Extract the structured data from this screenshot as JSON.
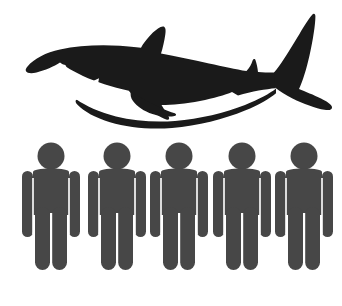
{
  "scene": {
    "title": "Shark and five people silhouette infographic",
    "background_color": "#ffffff",
    "width": 342,
    "height": 306
  },
  "shark": {
    "label": "Shark silhouette",
    "icon_name": "shark-icon",
    "color": "#1a1a1a",
    "facing": "left",
    "count": 1,
    "eye": {
      "label": "Shark eye",
      "color": "#ffffff",
      "cx": 63,
      "cy": 68,
      "r": 3.4
    },
    "mouth": {
      "label": "Shark mouth with teeth",
      "color": "#ffffff",
      "teeth_count": 4
    },
    "parts": [
      {
        "name": "snout",
        "label": "Snout"
      },
      {
        "name": "dorsal-fin",
        "label": "Dorsal fin"
      },
      {
        "name": "pectoral-fin",
        "label": "Pectoral fin"
      },
      {
        "name": "caudal-fin",
        "label": "Tail fin"
      },
      {
        "name": "belly",
        "label": "Belly"
      }
    ]
  },
  "people": {
    "label": "People silhouettes",
    "icon_name": "person-icon",
    "color": "#474747",
    "count": 5,
    "figures": [
      {
        "label": "Person 1",
        "x": 51
      },
      {
        "label": "Person 2",
        "x": 117
      },
      {
        "label": "Person 3",
        "x": 179
      },
      {
        "label": "Person 4",
        "x": 242
      },
      {
        "label": "Person 5",
        "x": 304
      }
    ],
    "geometry": {
      "head_cy": 156,
      "head_r": 13.5,
      "torso_top": 170,
      "torso_bottom": 215,
      "torso_half_width": 29,
      "arm_bottom": 237,
      "arm_width": 11,
      "leg_top": 207,
      "leg_bottom": 270,
      "leg_width": 15,
      "leg_gap": 2.5
    }
  }
}
